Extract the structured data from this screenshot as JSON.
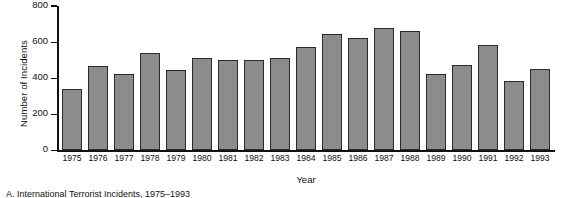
{
  "chart_data": {
    "type": "bar",
    "title": "",
    "caption": "A. International Terrorist Incidents, 1975–1993",
    "xlabel": "Year",
    "ylabel": "Number of Incidents",
    "categories": [
      "1975",
      "1976",
      "1977",
      "1978",
      "1979",
      "1980",
      "1981",
      "1982",
      "1983",
      "1984",
      "1985",
      "1986",
      "1987",
      "1988",
      "1989",
      "1990",
      "1991",
      "1992",
      "1993"
    ],
    "values": [
      340,
      470,
      425,
      540,
      445,
      510,
      500,
      500,
      510,
      575,
      645,
      625,
      680,
      660,
      425,
      475,
      585,
      385,
      450
    ],
    "ylim": [
      0,
      800
    ],
    "yticks": [
      0,
      200,
      400,
      600,
      800
    ],
    "ytick_labels": [
      "0",
      "200",
      "400",
      "600",
      "800"
    ],
    "grid": false,
    "legend": false,
    "bar_color": "#8c8c8c",
    "bar_edge_color": "#2b2b2b",
    "axis_color": "#111111",
    "background": "#ffffff"
  }
}
